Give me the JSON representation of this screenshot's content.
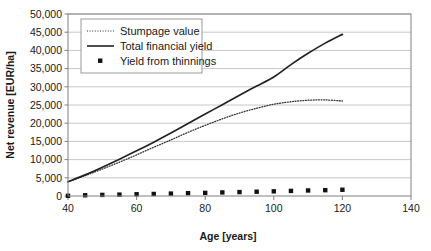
{
  "chart_data": {
    "type": "line",
    "title": "",
    "xlabel": "Age [years]",
    "ylabel": "Net revenue [EUR/ha]",
    "xlim": [
      40,
      140
    ],
    "ylim": [
      0,
      50000
    ],
    "xticks": [
      40,
      60,
      80,
      100,
      120,
      140
    ],
    "xtick_labels": [
      "40",
      "60",
      "80",
      "100",
      "120",
      "140"
    ],
    "yticks": [
      0,
      5000,
      10000,
      15000,
      20000,
      25000,
      30000,
      35000,
      40000,
      45000,
      50000
    ],
    "ytick_labels": [
      "0",
      "5,000",
      "10,000",
      "15,000",
      "20,000",
      "25,000",
      "30,000",
      "35,000",
      "40,000",
      "45,000",
      "50,000"
    ],
    "grid": "horizontal",
    "legend_position": "upper-left-inside",
    "series": [
      {
        "name": "Stumpage value",
        "style": "dotted",
        "color": "#333333",
        "x": [
          40,
          45,
          50,
          55,
          60,
          65,
          70,
          75,
          80,
          85,
          90,
          95,
          100,
          105,
          110,
          115,
          120
        ],
        "values": [
          3900,
          5600,
          7400,
          9300,
          11300,
          13400,
          15400,
          17500,
          19400,
          21200,
          22800,
          24100,
          25200,
          25900,
          26300,
          26400,
          26100
        ]
      },
      {
        "name": "Total financial yield",
        "style": "solid",
        "color": "#222222",
        "x": [
          40,
          45,
          50,
          55,
          60,
          65,
          70,
          75,
          80,
          85,
          90,
          95,
          100,
          105,
          110,
          115,
          120
        ],
        "values": [
          3900,
          5800,
          7900,
          10100,
          12400,
          14800,
          17300,
          19900,
          22500,
          25100,
          27700,
          30200,
          32700,
          36100,
          39200,
          42000,
          44400
        ]
      },
      {
        "name": "Yield from thinnings",
        "style": "markers",
        "color": "#111111",
        "x": [
          40,
          45,
          50,
          55,
          60,
          65,
          70,
          75,
          80,
          85,
          90,
          95,
          100,
          105,
          110,
          115,
          120
        ],
        "values": [
          60,
          200,
          300,
          380,
          480,
          560,
          660,
          780,
          860,
          980,
          1080,
          1180,
          1280,
          1400,
          1520,
          1600,
          1720
        ]
      }
    ]
  },
  "legend": {
    "items": [
      {
        "label": "Stumpage value",
        "style": "dotted"
      },
      {
        "label": "Total financial yield",
        "style": "solid"
      },
      {
        "label": "Yield from thinnings",
        "style": "markers"
      }
    ]
  },
  "colors": {
    "plot_border": "#808080",
    "gridline": "#c8c8c8",
    "axis_line": "#808080",
    "text": "#1a1a1a",
    "legend_border": "#9a9a9a",
    "background": "#ffffff"
  }
}
